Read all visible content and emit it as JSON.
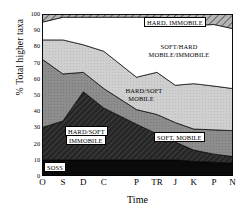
{
  "chart_data": {
    "type": "area",
    "title": "",
    "xlabel": "Time",
    "ylabel": "% Total higher taxa",
    "categories": [
      "O",
      "S",
      "D",
      "C",
      "P",
      "TR",
      "J",
      "K",
      "P",
      "N"
    ],
    "x": [
      0,
      1,
      2,
      3,
      4.6,
      5.6,
      6.5,
      7.4,
      8.4,
      9.3
    ],
    "ylim": [
      0,
      100
    ],
    "xlim": [
      0,
      9.3
    ],
    "yticks": [
      0,
      10,
      20,
      30,
      40,
      50,
      60,
      70,
      80,
      90,
      100
    ],
    "grid": false,
    "stacked": true,
    "legend_position": "inline-annotations",
    "series": [
      {
        "name": "SOSS",
        "label": "SOSS",
        "fill": "black-solid",
        "values": [
          10,
          10,
          10,
          10,
          10,
          10,
          10,
          9,
          8.5,
          8
        ]
      },
      {
        "name": "HARD/SOFT IMMOBILE",
        "label": "HARD/SOFT IMMOBILE",
        "fill": "dark-hatch",
        "values": [
          20,
          24,
          42,
          32,
          22,
          16,
          11,
          7,
          5,
          4
        ]
      },
      {
        "name": "SOFT, MOBILE",
        "label": "SOFT, MOBILE",
        "fill": "mid-grey",
        "values": [
          42,
          29,
          12,
          12,
          9,
          12,
          12,
          13,
          15,
          16
        ]
      },
      {
        "name": "HARD/SOFT MOBILE",
        "label": "HARD/SOFT MOBILE",
        "fill": "light-grey-hatch",
        "values": [
          12,
          21,
          17,
          23,
          20,
          26,
          23,
          28,
          27,
          26
        ]
      },
      {
        "name": "SOFT/HARD MOBILE/IMMOBILE",
        "label": "SOFT/HARD MOBILE/IMMOBILE",
        "fill": "white",
        "values": [
          11,
          14,
          17,
          21,
          37,
          34,
          38,
          36,
          38,
          37
        ]
      },
      {
        "name": "HARD, IMMOBILE",
        "label": "HARD, IMMOBILE",
        "fill": "diagonal-hatch",
        "values": [
          5,
          2,
          2,
          2,
          2,
          2,
          6,
          7,
          6.5,
          9
        ]
      }
    ],
    "cumulative_boundaries": {
      "soss_top": [
        10,
        10,
        10,
        10,
        10,
        10,
        10,
        9,
        8.5,
        8
      ],
      "hardsoft_imm_top": [
        30,
        34,
        52,
        42,
        32,
        26,
        21,
        16,
        13.5,
        12
      ],
      "soft_mobile_top": [
        72,
        63,
        64,
        54,
        41,
        38,
        33,
        29,
        28.5,
        28
      ],
      "hardsoft_mob_top": [
        84,
        84,
        81,
        77,
        61,
        64,
        56,
        57,
        55.5,
        54
      ],
      "softhard_top": [
        95,
        98,
        98,
        98,
        98,
        98,
        94,
        93,
        93.5,
        91
      ],
      "total_top": [
        100,
        100,
        100,
        100,
        100,
        100,
        100,
        100,
        100,
        100
      ]
    }
  },
  "annotations": [
    {
      "name": "hard-immobile",
      "text": "HARD, IMMOBILE",
      "style": "boxed"
    },
    {
      "name": "softhard-line1",
      "text": "SOFT/HARD",
      "style": "plain"
    },
    {
      "name": "softhard-line2",
      "text": "MOBILE/IMMOBILE",
      "style": "plain"
    },
    {
      "name": "hardsoft-mob-line1",
      "text": "HARD/SOFT",
      "style": "plain"
    },
    {
      "name": "hardsoft-mob-line2",
      "text": "MOBILE",
      "style": "plain"
    },
    {
      "name": "soft-mobile",
      "text": "SOFT, MOBILE",
      "style": "boxed"
    },
    {
      "name": "hardsoft-imm-line1",
      "text": "HARD/SOFT",
      "style": "boxed"
    },
    {
      "name": "hardsoft-imm-line2",
      "text": "IMMOBILE",
      "style": "boxed"
    },
    {
      "name": "soss",
      "text": "SOSS",
      "style": "boxed"
    }
  ],
  "colors": {
    "axis": "#000000",
    "soss": "#0a0a0a",
    "hardsoft_immobile": "#2e2e2e",
    "soft_mobile": "#8a8a8a",
    "hardsoft_mobile": "#c9c9c9",
    "softhard": "#ffffff",
    "hard_immobile": "#9a9a9a"
  }
}
